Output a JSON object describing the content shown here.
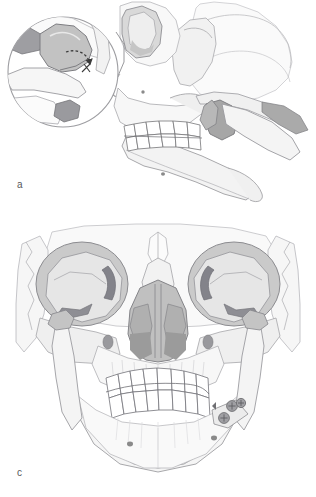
{
  "figure": {
    "background_color": "#ffffff",
    "width": 316,
    "height": 497,
    "style": "grayscale medical line illustration"
  },
  "panels": [
    {
      "id": "a",
      "label": "a",
      "label_color": "#58585a",
      "view": "lateral skull view",
      "description": "Lateral view of skull and mandible with displaced condyle; magnified inset circle at upper left shows the condylar head with a dashed rotation arrow",
      "regions": [
        {
          "name": "cranial-vault",
          "shade": "#f4f4f4"
        },
        {
          "name": "orbit",
          "shade": "#dcdcdc"
        },
        {
          "name": "zygomatic-arch",
          "shade": "#efefef"
        },
        {
          "name": "maxilla",
          "shade": "#f7f7f7"
        },
        {
          "name": "mandible-body",
          "shade": "#f2f2f2"
        },
        {
          "name": "mandibular-ramus-displaced",
          "shade": "#b4b4b4"
        },
        {
          "name": "condylar-head-fragment",
          "shade": "#9e9e9e"
        },
        {
          "name": "upper-teeth-row",
          "shade": "#ffffff"
        },
        {
          "name": "lower-teeth-row",
          "shade": "#ffffff"
        },
        {
          "name": "mental-foramen",
          "shade": "#8a8a8a"
        }
      ],
      "inset": {
        "name": "condyle-magnification-inset",
        "shape": "circle",
        "center_x": 63,
        "center_y": 72,
        "radius": 55,
        "contents": "condylar head, glenoid fossa, articular eminence and fracture line",
        "arrow": {
          "name": "rotation-arrow",
          "style": "dashed curved arrow",
          "color": "#3b3b3b",
          "meaning": "direction of condylar rotation/displacement"
        }
      }
    },
    {
      "id": "c",
      "label": "c",
      "label_color": "#58585a",
      "view": "frontal (anteroposterior) skull view",
      "description": "Frontal view of skull showing orbits, nasal aperture, maxilla, mandible in occlusion and fixation screws along the right mandibular angle",
      "regions": [
        {
          "name": "frontal-bone",
          "shade": "#f6f6f6"
        },
        {
          "name": "left-orbit",
          "shade": "#c9c9c9"
        },
        {
          "name": "right-orbit",
          "shade": "#c9c9c9"
        },
        {
          "name": "orbital-fissure",
          "shade": "#8e8e8e"
        },
        {
          "name": "nasal-aperture",
          "shade": "#bdbdbd"
        },
        {
          "name": "nasal-turbinate",
          "shade": "#a6a6a6"
        },
        {
          "name": "zygomatic-bone",
          "shade": "#eaeaea"
        },
        {
          "name": "maxilla",
          "shade": "#f5f5f5"
        },
        {
          "name": "mandible",
          "shade": "#f4f4f4"
        },
        {
          "name": "upper-teeth-row",
          "shade": "#ffffff"
        },
        {
          "name": "lower-teeth-row",
          "shade": "#ffffff"
        },
        {
          "name": "infraorbital-foramen",
          "shade": "#9a9a9a"
        },
        {
          "name": "mental-foramen",
          "shade": "#8a8a8a"
        }
      ],
      "hardware": {
        "name": "fixation-screws",
        "count": 3,
        "color": "#7a7a7a",
        "location": "right mandibular angle / ramus",
        "description": "round screw heads with cross-slot drive, part of internal fixation plate"
      }
    }
  ],
  "palette": {
    "outline": "#6f6f73",
    "outline_light": "#b9b9bd",
    "fill_lightest": "#fbfbfb",
    "fill_light": "#ededed",
    "fill_mid": "#c9c9c9",
    "fill_dark": "#a2a2a2",
    "fill_darkest": "#8a8a8a",
    "label_text": "#58585a",
    "background": "#ffffff"
  }
}
